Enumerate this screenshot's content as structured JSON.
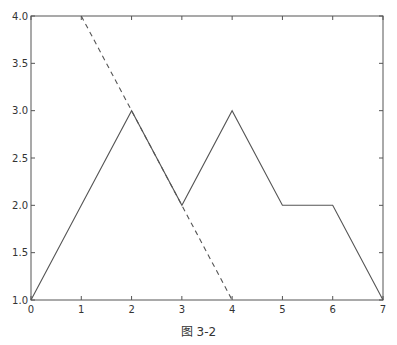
{
  "chart_data": {
    "type": "line",
    "title": "",
    "xlabel": "",
    "ylabel": "",
    "xlim": [
      0,
      7
    ],
    "ylim": [
      1.0,
      4.0
    ],
    "grid": false,
    "legend": null,
    "x_ticks": [
      0,
      1,
      2,
      3,
      4,
      5,
      6,
      7
    ],
    "x_tick_labels": [
      "0",
      "1",
      "2",
      "3",
      "4",
      "5",
      "6",
      "7"
    ],
    "y_ticks": [
      1.0,
      1.5,
      2.0,
      2.5,
      3.0,
      3.5,
      4.0
    ],
    "y_tick_labels": [
      "1.0",
      "1.5",
      "2.0",
      "2.5",
      "3.0",
      "3.5",
      "4.0"
    ],
    "series": [
      {
        "name": "solid",
        "style": "solid",
        "color": "#555555",
        "x": [
          0,
          1,
          2,
          3,
          4,
          5,
          6,
          7
        ],
        "y": [
          1,
          2,
          3,
          2,
          3,
          2,
          2,
          1
        ]
      },
      {
        "name": "dashed",
        "style": "dashed",
        "color": "#555555",
        "x": [
          1,
          4
        ],
        "y": [
          4,
          1
        ]
      }
    ]
  },
  "caption": "图 3-2"
}
